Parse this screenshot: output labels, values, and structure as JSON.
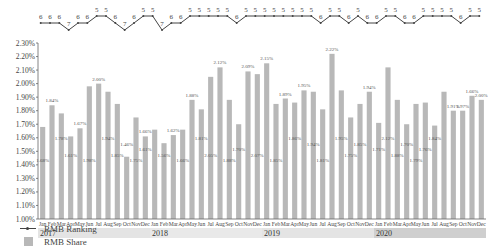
{
  "chart_data": {
    "type": "bar",
    "title": "",
    "xlabel": "",
    "ylabel": "",
    "ylim": [
      1.0,
      2.3
    ],
    "yticks": [
      "1.00%",
      "1.10%",
      "1.20%",
      "1.30%",
      "1.40%",
      "1.50%",
      "1.60%",
      "1.70%",
      "1.80%",
      "1.90%",
      "2.00%",
      "2.10%",
      "2.20%",
      "2.30%"
    ],
    "years": [
      "2017",
      "2018",
      "2019",
      "2020"
    ],
    "months": [
      "Jan",
      "Feb",
      "Mar",
      "Apr",
      "May",
      "Jun",
      "Jul",
      "Aug",
      "Sep",
      "Oct",
      "Nov",
      "Dec"
    ],
    "series": [
      {
        "name": "RMB Share",
        "type": "bar",
        "color": "#b8b8b8",
        "values": [
          1.68,
          1.84,
          1.78,
          1.61,
          1.67,
          1.98,
          2.0,
          1.94,
          1.85,
          1.46,
          1.75,
          1.61,
          1.66,
          1.56,
          1.62,
          1.66,
          1.88,
          1.81,
          2.05,
          2.12,
          1.88,
          1.7,
          2.09,
          2.07,
          2.15,
          1.85,
          1.89,
          1.86,
          1.95,
          1.94,
          1.81,
          2.22,
          1.95,
          1.75,
          1.85,
          1.94,
          1.71,
          2.12,
          1.88,
          1.7,
          1.85,
          1.86,
          1.69,
          1.94,
          1.8,
          1.8,
          1.91,
          1.88
        ],
        "mid_labels": [
          "1.68%",
          "",
          "1.78%",
          "1.61%",
          "",
          "1.98%",
          "",
          "1.94%",
          "1.85%",
          "1.46%",
          "1.75%",
          "1.61%",
          "",
          "1.56%",
          "",
          "1.66%",
          "",
          "1.81%",
          "2.05%",
          "",
          "1.88%",
          "1.70%",
          "",
          "2.07%",
          "",
          "1.85%",
          "",
          "1.86%",
          "",
          "1.94%",
          "1.81%",
          "",
          "1.95%",
          "1.75%",
          "1.85%",
          "",
          "1.71%",
          "2.12%",
          "1.88%",
          "1.70%",
          "1.79%",
          "1.76%",
          "1.84%",
          "",
          "",
          "",
          "",
          ""
        ],
        "top_labels": [
          "",
          "1.84%",
          "",
          "",
          "1.67%",
          "",
          "2.00%",
          "",
          "",
          "",
          "",
          "1.66%",
          "",
          "",
          "1.62%",
          "",
          "1.88%",
          "",
          "",
          "2.12%",
          "",
          "",
          "2.09%",
          "",
          "2.15%",
          "",
          "1.89%",
          "",
          "1.95%",
          "",
          "",
          "2.22%",
          "",
          "",
          "",
          "1.94%",
          "",
          "",
          "",
          "",
          "",
          "",
          "",
          "",
          "1.91%",
          "1.97%",
          "1.66%",
          "2.00%",
          "1.89%"
        ]
      },
      {
        "name": "RMB Ranking",
        "type": "line",
        "color": "#444444",
        "values": [
          6,
          6,
          6,
          7,
          6,
          6,
          5,
          5,
          6,
          7,
          6,
          5,
          5,
          7,
          6,
          6,
          5,
          5,
          5,
          5,
          5,
          6,
          5,
          5,
          5,
          5,
          5,
          5,
          5,
          5,
          6,
          5,
          5,
          6,
          5,
          6,
          6,
          5,
          5,
          6,
          6,
          5,
          5,
          5,
          5,
          6,
          5,
          5
        ]
      }
    ],
    "legend": [
      "RMB Ranking",
      "RMB Share"
    ],
    "legend_position": "bottom-left",
    "grid": false
  },
  "legend": {
    "ranking_label": "RMB Ranking",
    "share_label": "RMB Share"
  }
}
